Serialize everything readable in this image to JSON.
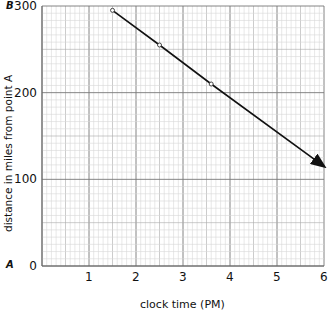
{
  "chart_data": {
    "type": "line",
    "title": "",
    "xlabel": "clock time (PM)",
    "ylabel": "distance in miles from point A",
    "xlim": [
      0,
      6
    ],
    "ylim": [
      0,
      300
    ],
    "x_ticks": [
      "1",
      "2",
      "3",
      "4",
      "5",
      "6"
    ],
    "y_ticks": [
      "0",
      "100",
      "200",
      "300"
    ],
    "grid": true,
    "point_labels": {
      "top": "B",
      "bottom": "A"
    },
    "series": [
      {
        "name": "distance",
        "x": [
          1.5,
          2.5,
          3.6,
          6.0
        ],
        "y": [
          295,
          255,
          210,
          115
        ],
        "markers": [
          true,
          true,
          true,
          false
        ],
        "end_arrow": true
      }
    ]
  }
}
